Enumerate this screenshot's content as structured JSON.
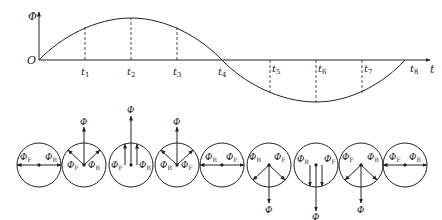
{
  "axes": {
    "y_label": "Φ",
    "x_label": "t",
    "origin_label": "O"
  },
  "time_ticks": [
    {
      "name": "t",
      "sub": "1"
    },
    {
      "name": "t",
      "sub": "2"
    },
    {
      "name": "t",
      "sub": "3"
    },
    {
      "name": "t",
      "sub": "4"
    },
    {
      "name": "t",
      "sub": "5"
    },
    {
      "name": "t",
      "sub": "6"
    },
    {
      "name": "t",
      "sub": "7"
    },
    {
      "name": "t",
      "sub": "8"
    }
  ],
  "phasor_labels": {
    "forward": {
      "main": "Φ",
      "sub": "F"
    },
    "reverse": {
      "main": "Φ",
      "sub": "R"
    },
    "resultant": "Φ"
  },
  "phasor_states": [
    {
      "instant": "O",
      "resultant": "zero",
      "left": "F",
      "right": "R"
    },
    {
      "instant": "t1",
      "resultant": "up-medium",
      "left": "F",
      "right": "R"
    },
    {
      "instant": "t2",
      "resultant": "up-max",
      "left": "F",
      "right": "R"
    },
    {
      "instant": "t3",
      "resultant": "up-medium",
      "left": "R",
      "right": "F"
    },
    {
      "instant": "t4",
      "resultant": "zero",
      "left": "R",
      "right": "F"
    },
    {
      "instant": "t5",
      "resultant": "down-medium",
      "left": "R",
      "right": "F"
    },
    {
      "instant": "t6",
      "resultant": "down-max",
      "left": "R",
      "right": "F"
    },
    {
      "instant": "t7",
      "resultant": "down-medium",
      "left": "F",
      "right": "R"
    },
    {
      "instant": "t8",
      "resultant": "zero",
      "left": "F",
      "right": "R"
    }
  ],
  "colors": {
    "stroke": "#222222",
    "background": "#ffffff"
  }
}
